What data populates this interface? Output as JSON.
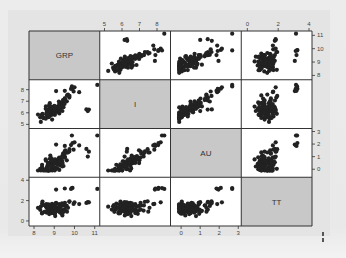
{
  "chart_data": {
    "type": "scatter",
    "subtype": "scatterplot-matrix",
    "title": "",
    "variables": [
      "GRP",
      "I",
      "AU",
      "TT"
    ],
    "diagonal_labels": [
      "GRP",
      "I",
      "AU",
      "TT"
    ],
    "ranges": {
      "GRP": [
        7.9,
        11.1
      ],
      "I": [
        4.9,
        8.6
      ],
      "AU": [
        -0.4,
        3.0
      ],
      "TT": [
        -0.2,
        4.0
      ]
    },
    "ticks": {
      "GRP": [
        8,
        9,
        10,
        11
      ],
      "I": [
        5,
        6,
        7,
        8
      ],
      "AU": [
        0,
        1,
        2,
        3
      ],
      "TT": [
        0,
        2,
        4
      ]
    },
    "axis_placement": {
      "top": [
        {
          "var": "I",
          "column": 1
        },
        {
          "var": "TT",
          "column": 3
        }
      ],
      "bottom": [
        {
          "var": "GRP",
          "column": 0
        },
        {
          "var": "AU",
          "column": 2
        }
      ],
      "left": [
        {
          "var": "I",
          "row": 1
        },
        {
          "var": "TT",
          "row": 3
        }
      ],
      "right": [
        {
          "var": "GRP",
          "row": 0
        },
        {
          "var": "AU",
          "row": 2
        }
      ]
    },
    "grid": false,
    "legend": null,
    "n_points_approx": 110,
    "clusters": [
      {
        "n": 90,
        "GRP": [
          9.0,
          0.35
        ],
        "I": [
          6.3,
          0.45
        ],
        "AU": [
          0.4,
          0.4
        ],
        "TT": [
          1.2,
          0.35
        ],
        "corr_GRP_I": 0.75,
        "corr_GRP_AU": 0.7,
        "corr_I_AU": 0.8
      },
      {
        "n": 8,
        "GRP": [
          9.8,
          0.25
        ],
        "I": [
          7.6,
          0.3
        ],
        "AU": [
          1.6,
          0.3
        ],
        "TT": [
          1.6,
          0.3
        ],
        "corr_GRP_I": 0.8,
        "corr_GRP_AU": 0.8,
        "corr_I_AU": 0.8
      },
      {
        "n": 6,
        "GRP": [
          9.9,
          0.45
        ],
        "I": [
          8.1,
          0.2
        ],
        "AU": [
          2.2,
          0.35
        ],
        "TT": [
          3.2,
          0.08
        ],
        "corr_GRP_I": 0.9,
        "corr_GRP_AU": 0.9,
        "corr_I_AU": 0.9
      },
      {
        "n": 3,
        "GRP": [
          10.7,
          0.12
        ],
        "I": [
          6.3,
          0.15
        ],
        "AU": [
          1.1,
          0.3
        ],
        "TT": [
          1.8,
          0.05
        ],
        "corr_GRP_I": 0.2,
        "corr_GRP_AU": 0.3,
        "corr_I_AU": 0.3
      }
    ],
    "colors": {
      "point": "#222222",
      "panel_bg": "#ffffff",
      "diagonal_bg": "#c8c8c8",
      "border": "#333333",
      "tick_text": "#444444"
    }
  }
}
